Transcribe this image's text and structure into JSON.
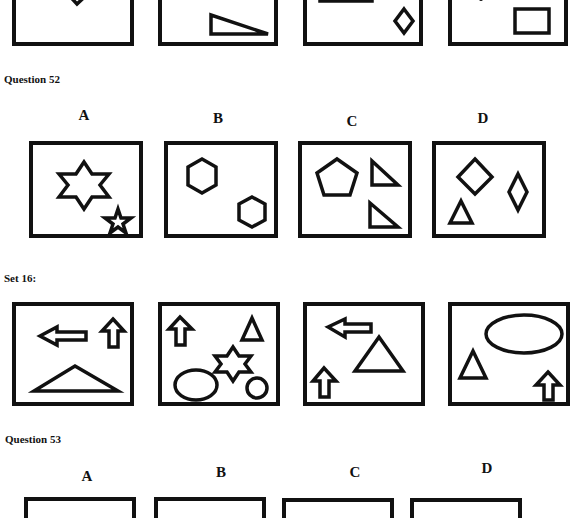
{
  "prev_question": {
    "panels": [
      {
        "id": "A",
        "shapes": [
          "diamond"
        ]
      },
      {
        "id": "B",
        "shapes": [
          "rectangle",
          "right-triangle"
        ]
      },
      {
        "id": "C",
        "shapes": [
          "rectangle",
          "diamond"
        ]
      },
      {
        "id": "D",
        "shapes": [
          "dot",
          "rectangle"
        ]
      }
    ]
  },
  "question52": {
    "title": "Question 52",
    "options": [
      {
        "label": "A",
        "shapes": [
          "six-point-star",
          "five-point-star"
        ]
      },
      {
        "label": "B",
        "shapes": [
          "hexagon",
          "hexagon"
        ]
      },
      {
        "label": "C",
        "shapes": [
          "pentagon",
          "right-triangle",
          "right-triangle"
        ]
      },
      {
        "label": "D",
        "shapes": [
          "diamond",
          "diamond",
          "triangle"
        ]
      }
    ]
  },
  "set16": {
    "title": "Set 16:",
    "panels": [
      {
        "id": "1",
        "shapes": [
          "left-arrow",
          "up-arrow",
          "wide-triangle"
        ]
      },
      {
        "id": "2",
        "shapes": [
          "up-arrow",
          "triangle",
          "six-point-star",
          "ellipse",
          "circle"
        ]
      },
      {
        "id": "3",
        "shapes": [
          "left-arrow",
          "triangle",
          "up-arrow"
        ]
      },
      {
        "id": "4",
        "shapes": [
          "ellipse",
          "triangle",
          "up-arrow"
        ]
      }
    ]
  },
  "question53": {
    "title": "Question 53",
    "options": [
      {
        "label": "A"
      },
      {
        "label": "B"
      },
      {
        "label": "C"
      },
      {
        "label": "D"
      }
    ]
  }
}
